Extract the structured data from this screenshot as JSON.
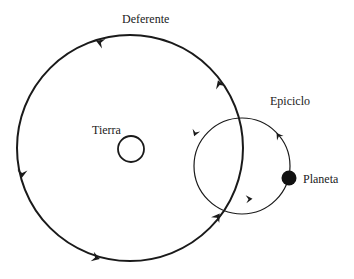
{
  "diagram": {
    "type": "ptolemaic-epicycle-model",
    "labels": {
      "deferent": "Deferente",
      "earth": "Tierra",
      "epicycle": "Epiciclo",
      "planet": "Planeta"
    },
    "colors": {
      "background": "#ffffff",
      "stroke": "#1a1a1a",
      "planet": "#111111"
    },
    "shapes": {
      "deferent": {
        "cx": 130,
        "cy": 148,
        "r": 113,
        "direction": "counterclockwise"
      },
      "earth": {
        "cx": 131,
        "cy": 149,
        "r": 13
      },
      "epicycle": {
        "cx": 242,
        "cy": 166,
        "r": 48,
        "direction": "counterclockwise"
      },
      "planet": {
        "cx": 289,
        "cy": 178,
        "r": 8
      }
    }
  }
}
